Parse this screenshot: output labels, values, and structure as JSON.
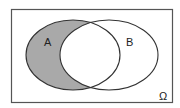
{
  "diagram": {
    "type": "venn",
    "universe_label": "Ω",
    "sets": [
      {
        "name": "A",
        "label": "A"
      },
      {
        "name": "B",
        "label": "B"
      }
    ],
    "shaded_region": "A minus B",
    "colors": {
      "shade": "#a9a9a9",
      "stroke": "#333333",
      "background": "#ffffff"
    }
  }
}
